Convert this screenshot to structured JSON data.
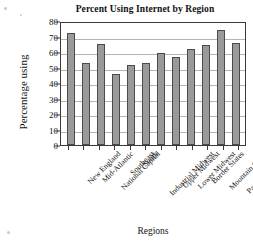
{
  "chart_data": {
    "type": "bar",
    "title": "Percent Using Internet by Region",
    "xlabel": "Regions",
    "ylabel": "Percentage using",
    "ylim": [
      0,
      80
    ],
    "ytick_step": 10,
    "yticks": [
      0,
      10,
      20,
      30,
      40,
      50,
      60,
      70,
      80
    ],
    "grid": true,
    "grid_axis": "y",
    "legend": "none",
    "bar_color": "#9a9a9a",
    "bar_edge_color": "#4a4a4a",
    "categories": [
      "New England",
      "Mid-Atlantic",
      "National Capital",
      "Southeast",
      "South",
      "Industrial Midwest",
      "Upper Midwest",
      "Lower Midwest",
      "Border States",
      "Mountain States",
      "Pacific Northwest",
      "California"
    ],
    "values": [
      72,
      53,
      65,
      46,
      51.5,
      53,
      59.5,
      57,
      62,
      64.5,
      74,
      66
    ]
  }
}
